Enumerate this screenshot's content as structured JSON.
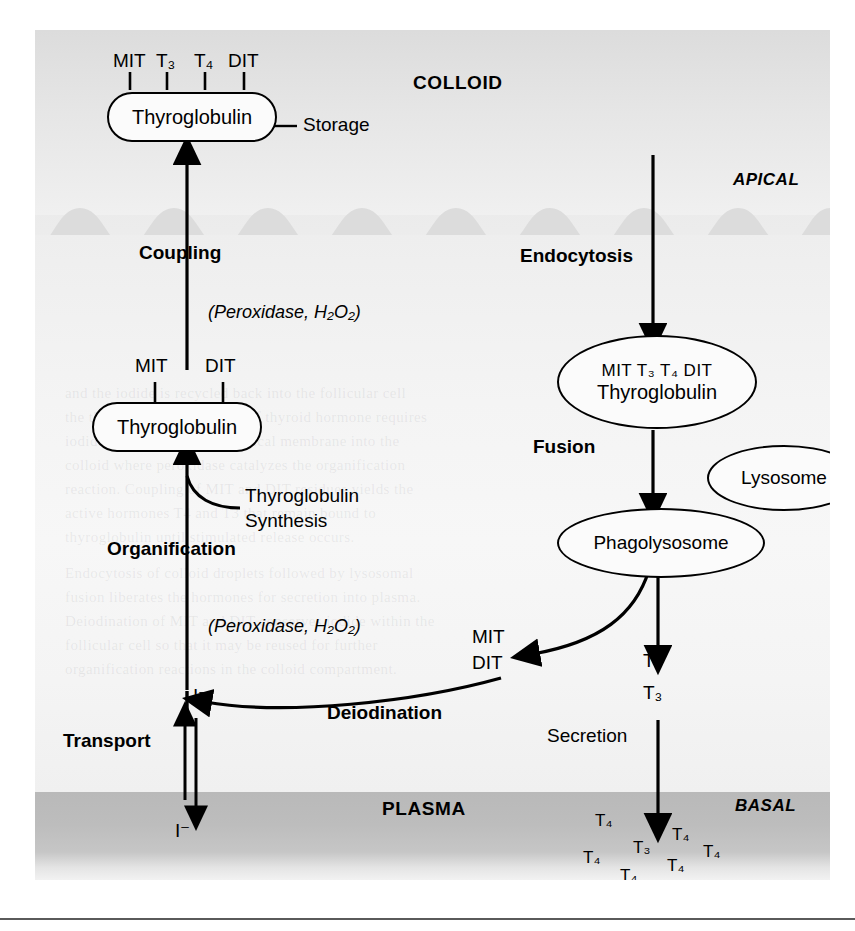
{
  "figure": {
    "regions": {
      "colloid": "COLLOID",
      "apical": "APICAL",
      "basal": "BASAL",
      "plasma": "PLASMA"
    },
    "colloid_storage": {
      "ticks": [
        "MIT",
        "T₃",
        "T₄",
        "DIT"
      ],
      "capsule_label": "Thyroglobulin",
      "side_label": "Storage"
    },
    "left_pathway": {
      "coupling": "Coupling",
      "coupling_enzyme": "(Peroxidase, H₂O₂)",
      "tg_ticks": [
        "MIT",
        "DIT"
      ],
      "tg_capsule_label": "Thyroglobulin",
      "synthesis_line1": "Thyroglobulin",
      "synthesis_line2": "Synthesis",
      "organification": "Organification",
      "organification_enzyme": "(Peroxidase, H₂O₂)",
      "iodide_membrane": "I⁻",
      "transport": "Transport",
      "iodide_plasma": "I⁻"
    },
    "right_pathway": {
      "endocytosis": "Endocytosis",
      "vesicle_top": "MIT  T₃ T₄  DIT",
      "vesicle_main": "Thyroglobulin",
      "fusion": "Fusion",
      "lysosome": "Lysosome",
      "phagolysosome": "Phagolysosome",
      "deiodination": "Deiodination",
      "recycled_line1": "MIT",
      "recycled_line2": "DIT",
      "released_line1": "T₄",
      "released_line2": "T₃",
      "secretion": "Secretion"
    },
    "plasma_hormones": [
      "T₄",
      "T₄",
      "T₃",
      "T₄",
      "T₄",
      "T₄",
      "T₄"
    ],
    "colors": {
      "ink": "#000000",
      "colloid_gray": "#e2e2e2",
      "cell_gray": "#f5f5f5",
      "plasma_gray": "#bdbdbd",
      "rule_gray": "#5a5a5a"
    }
  },
  "background_text": {
    "lines": [
      "and the iodide is recycled back into the follicular cell",
      "the thyroid gland. Synthesis of thyroid hormone requires",
      "iodide transport across the apical membrane into the",
      "colloid where peroxidase catalyzes the organification",
      "reaction. Coupling of MIT and DIT residues yields the",
      "active hormones T4 and T3 that remain bound to",
      "thyroglobulin until stimulated release occurs.",
      "Endocytosis of colloid droplets followed by lysosomal",
      "fusion liberates the hormones for secretion into plasma.",
      "Deiodination of MIT and DIT conserves iodide within the",
      "follicular cell so that it may be reused for further",
      "organification reactions in the colloid compartment."
    ]
  }
}
